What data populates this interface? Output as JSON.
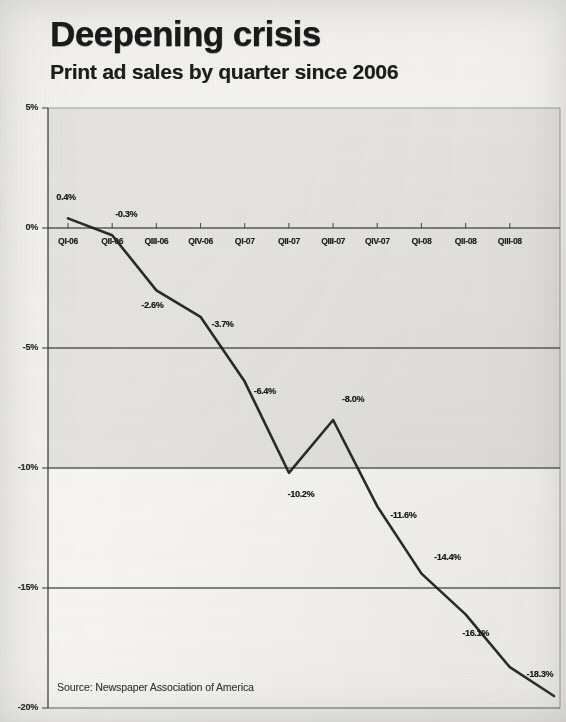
{
  "header": {
    "title": "Deepening crisis",
    "subtitle": "Print ad sales by quarter since 2006"
  },
  "source_note": "Source: Newspaper Association of America",
  "colors": {
    "ink": "#191919",
    "line": "#1a1a1a",
    "plot_fill": "#e2e1dd",
    "paper": "#f3f2ef",
    "gridline": "#3b3b3b"
  },
  "chart_data": {
    "type": "line",
    "title": "Deepening crisis",
    "subtitle": "Print ad sales by quarter since 2006",
    "xlabel": "",
    "ylabel": "",
    "grid": true,
    "legend": false,
    "ylim": [
      -20,
      5
    ],
    "yticks": [
      5,
      0,
      -5,
      -10,
      -15,
      -20
    ],
    "ytick_labels": [
      "5%",
      "0%",
      "-5%",
      "-10%",
      "-15%",
      "-20%"
    ],
    "categories": [
      "QI-06",
      "QII-06",
      "QIII-06",
      "QIV-06",
      "QI-07",
      "QII-07",
      "QIII-07",
      "QIV-07",
      "QI-08",
      "QII-08",
      "QIII-08",
      ""
    ],
    "x_tick_labels": [
      "QI-06",
      "QII-06",
      "QIII-06",
      "QIV-06",
      "QI-07",
      "QII-07",
      "QIII-07",
      "QIV-07",
      "QI-08",
      "QII-08",
      "QIII-08"
    ],
    "values": [
      0.4,
      -0.3,
      -2.6,
      -3.7,
      -6.4,
      -10.2,
      -8.0,
      -11.6,
      -14.4,
      -16.1,
      -18.3,
      -19.5
    ],
    "point_labels": [
      "0.4%",
      "-0.3%",
      "-2.6%",
      "-3.7%",
      "-6.4%",
      "-10.2%",
      "-8.0%",
      "-11.6%",
      "-14.4%",
      "-16.1%",
      "-18.3%"
    ],
    "series": [
      {
        "name": "Print ad sales change",
        "values": [
          0.4,
          -0.3,
          -2.6,
          -3.7,
          -6.4,
          -10.2,
          -8.0,
          -11.6,
          -14.4,
          -16.1,
          -18.3,
          -19.5
        ]
      }
    ],
    "source": "Newspaper Association of America"
  }
}
